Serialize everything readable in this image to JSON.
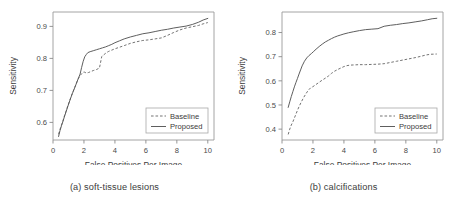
{
  "figure": {
    "panel_count": 2
  },
  "chart_data": [
    {
      "type": "line",
      "title": "",
      "caption": "(a) soft-tissue lesions",
      "xlabel": "False Positives Per Image",
      "ylabel": "Sensitivity",
      "xlim": [
        0,
        10.4
      ],
      "ylim": [
        0.545,
        0.945
      ],
      "xticks": [
        0,
        2,
        4,
        6,
        8,
        10
      ],
      "xticklabels": [
        "0",
        "2",
        "4",
        "6",
        "8",
        "10"
      ],
      "yticks": [
        0.6,
        0.7,
        0.8,
        0.9
      ],
      "yticklabels": [
        "0.6",
        "0.7",
        "0.8",
        "0.9"
      ],
      "grid": false,
      "legend_position": "lower right",
      "legend": [
        "Baseline",
        "Proposed"
      ],
      "series": [
        {
          "name": "Baseline",
          "style": "dashed",
          "color": "#6b6b6b",
          "x": [
            0.36,
            0.45,
            0.55,
            0.65,
            0.75,
            0.85,
            0.95,
            1.05,
            1.15,
            1.25,
            1.35,
            1.45,
            1.55,
            1.65,
            1.75,
            1.85,
            1.95,
            2.05,
            2.15,
            2.3,
            2.45,
            2.6,
            2.8,
            3.0,
            3.15,
            3.3,
            3.45,
            3.6,
            3.8,
            4.0,
            4.3,
            4.6,
            5.0,
            5.4,
            5.8,
            6.2,
            6.6,
            7.0,
            7.4,
            7.8,
            8.2,
            8.6,
            9.0,
            9.4,
            9.7,
            10.0
          ],
          "y": [
            0.563,
            0.578,
            0.592,
            0.606,
            0.622,
            0.636,
            0.651,
            0.664,
            0.678,
            0.691,
            0.703,
            0.715,
            0.727,
            0.738,
            0.746,
            0.752,
            0.757,
            0.757,
            0.754,
            0.756,
            0.759,
            0.762,
            0.765,
            0.77,
            0.806,
            0.812,
            0.818,
            0.822,
            0.826,
            0.83,
            0.835,
            0.84,
            0.847,
            0.852,
            0.856,
            0.858,
            0.861,
            0.864,
            0.872,
            0.881,
            0.889,
            0.895,
            0.899,
            0.903,
            0.908,
            0.912
          ]
        },
        {
          "name": "Proposed",
          "style": "solid",
          "color": "#555555",
          "x": [
            0.36,
            0.45,
            0.55,
            0.65,
            0.75,
            0.85,
            0.95,
            1.05,
            1.15,
            1.25,
            1.35,
            1.45,
            1.55,
            1.65,
            1.75,
            1.85,
            1.95,
            2.05,
            2.15,
            2.25,
            2.4,
            2.6,
            2.8,
            3.0,
            3.2,
            3.4,
            3.6,
            3.8,
            4.0,
            4.3,
            4.6,
            5.0,
            5.4,
            5.8,
            6.2,
            6.6,
            7.0,
            7.4,
            7.8,
            8.2,
            8.6,
            9.0,
            9.4,
            9.7,
            10.0
          ],
          "y": [
            0.556,
            0.574,
            0.59,
            0.604,
            0.62,
            0.634,
            0.649,
            0.663,
            0.677,
            0.69,
            0.702,
            0.714,
            0.727,
            0.739,
            0.751,
            0.772,
            0.791,
            0.805,
            0.812,
            0.818,
            0.821,
            0.824,
            0.827,
            0.83,
            0.833,
            0.836,
            0.84,
            0.844,
            0.849,
            0.855,
            0.861,
            0.867,
            0.872,
            0.877,
            0.88,
            0.884,
            0.888,
            0.891,
            0.895,
            0.898,
            0.901,
            0.906,
            0.913,
            0.92,
            0.925
          ]
        }
      ]
    },
    {
      "type": "line",
      "title": "",
      "caption": "(b) calcifications",
      "xlabel": "False Positives Per Image",
      "ylabel": "Sensitivity",
      "xlim": [
        0,
        10.4
      ],
      "ylim": [
        0.355,
        0.885
      ],
      "xticks": [
        0,
        2,
        4,
        6,
        8,
        10
      ],
      "xticklabels": [
        "0",
        "2",
        "4",
        "6",
        "8",
        "10"
      ],
      "yticks": [
        0.4,
        0.5,
        0.6,
        0.7,
        0.8
      ],
      "yticklabels": [
        "0.4",
        "0.5",
        "0.6",
        "0.7",
        "0.8"
      ],
      "grid": false,
      "legend_position": "lower right",
      "legend": [
        "Baseline",
        "Proposed"
      ],
      "series": [
        {
          "name": "Baseline",
          "style": "dashed",
          "color": "#6b6b6b",
          "x": [
            0.4,
            0.5,
            0.6,
            0.7,
            0.8,
            0.9,
            1.0,
            1.1,
            1.25,
            1.4,
            1.55,
            1.7,
            1.85,
            2.0,
            2.2,
            2.4,
            2.6,
            2.8,
            3.0,
            3.2,
            3.4,
            3.6,
            3.8,
            4.0,
            4.2,
            4.4,
            4.7,
            5.0,
            5.4,
            5.8,
            6.2,
            6.6,
            7.0,
            7.4,
            7.8,
            8.2,
            8.6,
            9.0,
            9.3,
            9.6,
            10.0
          ],
          "y": [
            0.378,
            0.4,
            0.417,
            0.43,
            0.446,
            0.462,
            0.478,
            0.493,
            0.513,
            0.531,
            0.547,
            0.561,
            0.571,
            0.576,
            0.585,
            0.594,
            0.603,
            0.611,
            0.62,
            0.631,
            0.64,
            0.647,
            0.653,
            0.659,
            0.663,
            0.665,
            0.666,
            0.667,
            0.667,
            0.668,
            0.669,
            0.671,
            0.676,
            0.681,
            0.686,
            0.691,
            0.696,
            0.702,
            0.707,
            0.71,
            0.711
          ]
        },
        {
          "name": "Proposed",
          "style": "solid",
          "color": "#555555",
          "x": [
            0.4,
            0.5,
            0.6,
            0.7,
            0.8,
            0.9,
            1.0,
            1.1,
            1.2,
            1.3,
            1.45,
            1.6,
            1.75,
            1.9,
            2.05,
            2.2,
            2.4,
            2.6,
            2.8,
            3.0,
            3.2,
            3.4,
            3.6,
            3.8,
            4.0,
            4.3,
            4.6,
            5.0,
            5.4,
            5.8,
            6.2,
            6.6,
            7.0,
            7.4,
            7.8,
            8.2,
            8.6,
            9.0,
            9.4,
            9.7,
            10.0
          ],
          "y": [
            0.49,
            0.513,
            0.535,
            0.555,
            0.575,
            0.593,
            0.61,
            0.628,
            0.645,
            0.662,
            0.681,
            0.695,
            0.705,
            0.713,
            0.722,
            0.731,
            0.742,
            0.752,
            0.761,
            0.768,
            0.775,
            0.781,
            0.786,
            0.79,
            0.794,
            0.799,
            0.803,
            0.808,
            0.812,
            0.814,
            0.816,
            0.826,
            0.83,
            0.833,
            0.837,
            0.84,
            0.844,
            0.848,
            0.853,
            0.857,
            0.859
          ]
        }
      ]
    }
  ]
}
